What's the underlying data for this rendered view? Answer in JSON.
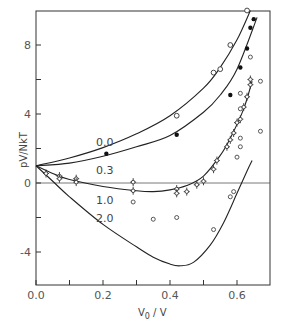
{
  "chart_data": {
    "type": "scatter",
    "title": "",
    "xlabel": "V0/V",
    "ylabel": "pV/NkT",
    "xlim": [
      0.0,
      0.7
    ],
    "ylim": [
      -6,
      10
    ],
    "x_ticks": [
      0.0,
      0.1,
      0.2,
      0.3,
      0.4,
      0.5,
      0.6
    ],
    "x_tick_labels": [
      "0.0",
      "0.2",
      "0.4",
      "0.6"
    ],
    "y_ticks": [
      -4,
      -2,
      0,
      2,
      4,
      6,
      8
    ],
    "y_tick_labels": [
      "-4",
      "0",
      "4",
      "8"
    ],
    "grid": false,
    "zero_line": true,
    "curves": [
      {
        "label": "0.0",
        "points": [
          [
            0,
            1
          ],
          [
            0.1,
            1.45
          ],
          [
            0.2,
            2.05
          ],
          [
            0.3,
            2.85
          ],
          [
            0.4,
            3.9
          ],
          [
            0.5,
            5.5
          ],
          [
            0.55,
            6.7
          ],
          [
            0.6,
            8.3
          ],
          [
            0.64,
            10
          ]
        ]
      },
      {
        "label": "0.3",
        "points": [
          [
            0,
            1
          ],
          [
            0.1,
            1.15
          ],
          [
            0.2,
            1.55
          ],
          [
            0.3,
            2.1
          ],
          [
            0.4,
            2.75
          ],
          [
            0.5,
            4.1
          ],
          [
            0.55,
            5.1
          ],
          [
            0.6,
            6.6
          ],
          [
            0.66,
            9.6
          ]
        ]
      },
      {
        "label": "1.0",
        "points": [
          [
            0,
            1
          ],
          [
            0.05,
            0.55
          ],
          [
            0.1,
            0.2
          ],
          [
            0.2,
            -0.2
          ],
          [
            0.3,
            -0.45
          ],
          [
            0.35,
            -0.5
          ],
          [
            0.4,
            -0.4
          ],
          [
            0.45,
            -0.15
          ],
          [
            0.5,
            0.4
          ],
          [
            0.55,
            1.6
          ],
          [
            0.58,
            2.6
          ],
          [
            0.62,
            4.3
          ],
          [
            0.645,
            5.9
          ]
        ]
      },
      {
        "label": "2.0",
        "points": [
          [
            0,
            1
          ],
          [
            0.05,
            0.1
          ],
          [
            0.1,
            -0.8
          ],
          [
            0.2,
            -2.4
          ],
          [
            0.3,
            -3.7
          ],
          [
            0.35,
            -4.3
          ],
          [
            0.4,
            -4.7
          ],
          [
            0.43,
            -4.8
          ],
          [
            0.47,
            -4.6
          ],
          [
            0.52,
            -3.6
          ],
          [
            0.56,
            -2.3
          ],
          [
            0.6,
            -0.6
          ],
          [
            0.63,
            0.7
          ],
          [
            0.645,
            1.3
          ]
        ]
      }
    ],
    "series": [
      {
        "name": "0.0 (open circles)",
        "marker": "open-circle",
        "points": [
          [
            0.42,
            3.9
          ],
          [
            0.53,
            6.4
          ],
          [
            0.55,
            6.6
          ],
          [
            0.58,
            8.0
          ],
          [
            0.63,
            10.0
          ]
        ]
      },
      {
        "name": "0.3 (filled circles)",
        "marker": "filled-circle",
        "points": [
          [
            0.21,
            1.7
          ],
          [
            0.42,
            2.8
          ],
          [
            0.58,
            5.1
          ],
          [
            0.61,
            6.7
          ],
          [
            0.63,
            7.8
          ],
          [
            0.64,
            9.0
          ],
          [
            0.65,
            9.5
          ]
        ]
      },
      {
        "name": "1.0 (circles with error bars)",
        "marker": "errorbar-circle",
        "points": [
          [
            0.03,
            0.55
          ],
          [
            0.07,
            0.4
          ],
          [
            0.07,
            0.25
          ],
          [
            0.12,
            0.25
          ],
          [
            0.12,
            0.05
          ],
          [
            0.29,
            0.05
          ],
          [
            0.29,
            -0.45
          ],
          [
            0.42,
            -0.35
          ],
          [
            0.42,
            -0.6
          ],
          [
            0.45,
            -0.5
          ],
          [
            0.48,
            -0.1
          ],
          [
            0.5,
            0.1
          ],
          [
            0.53,
            0.8
          ],
          [
            0.54,
            1.3
          ],
          [
            0.57,
            2.1
          ],
          [
            0.58,
            2.5
          ],
          [
            0.59,
            2.9
          ],
          [
            0.6,
            3.5
          ],
          [
            0.61,
            3.7
          ],
          [
            0.62,
            4.4
          ],
          [
            0.63,
            5.0
          ],
          [
            0.64,
            5.7
          ],
          [
            0.64,
            6.0
          ]
        ]
      },
      {
        "name": "2.0 (open circles)",
        "marker": "small-open-circle",
        "points": [
          [
            0.29,
            -1.1
          ],
          [
            0.35,
            -2.1
          ],
          [
            0.42,
            -2.0
          ],
          [
            0.53,
            -2.7
          ],
          [
            0.58,
            -0.8
          ],
          [
            0.59,
            -0.5
          ],
          [
            0.6,
            1.5
          ],
          [
            0.61,
            2.1
          ],
          [
            0.61,
            4.3
          ],
          [
            0.61,
            5.2
          ],
          [
            0.61,
            2.6
          ],
          [
            0.64,
            7.3
          ],
          [
            0.67,
            5.9
          ],
          [
            0.67,
            3.0
          ]
        ]
      }
    ]
  }
}
